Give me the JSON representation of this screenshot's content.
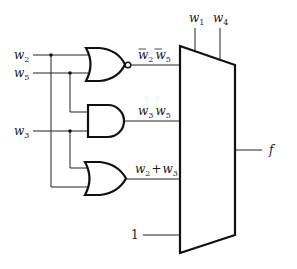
{
  "diagram": {
    "type": "logic-circuit",
    "inputs": {
      "w2": {
        "label": "w",
        "sub": "2"
      },
      "w5": {
        "label": "w",
        "sub": "5"
      },
      "w3": {
        "label": "w",
        "sub": "3"
      }
    },
    "select_inputs": [
      {
        "label": "w",
        "sub": "1"
      },
      {
        "label": "w",
        "sub": "4"
      }
    ],
    "gates": [
      {
        "type": "NOR",
        "inputs": [
          "w2",
          "w5"
        ],
        "output_label": "w̄2 w̄5"
      },
      {
        "type": "AND",
        "inputs": [
          "w5",
          "w3"
        ],
        "output_label": "w3 w5"
      },
      {
        "type": "OR",
        "inputs": [
          "w3",
          "w2"
        ],
        "output_label": "w2 + w3"
      }
    ],
    "mux_inputs": [
      {
        "text_a": "w",
        "sub_a": "2",
        "text_b": "w",
        "sub_b": "5",
        "overbar": true
      },
      {
        "text_a": "w",
        "sub_a": "3",
        "text_b": "w",
        "sub_b": "5",
        "op": ""
      },
      {
        "text_a": "w",
        "sub_a": "2",
        "text_b": "w",
        "sub_b": "3",
        "op": "+"
      },
      {
        "constant": "1"
      }
    ],
    "output": {
      "label": "f"
    },
    "colors": {
      "line": "#111111",
      "background": "#ffffff"
    }
  }
}
